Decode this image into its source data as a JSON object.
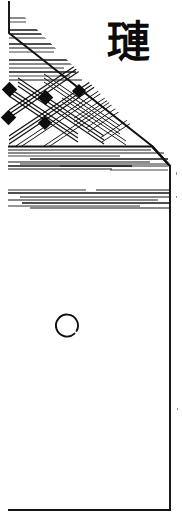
{
  "figure": {
    "medium": "scanned ink line drawing",
    "background_color": "#ffffff",
    "ink_color": "#101010",
    "width_px": 182,
    "height_px": 521
  },
  "label": {
    "character": "璉",
    "reading": "hun",
    "position": "upper-right",
    "color": "#0b0b0b"
  },
  "object_outline": {
    "description": "Vessel body with sloping shoulder, rendered as a closed polygon",
    "points": "9,1 9,33 152,146 170,166 170,510 8,510",
    "stroke_color": "#101010"
  },
  "regions": [
    {
      "name": "upper-hatched-triangle",
      "description": "Triangular shoulder zone filled with horizontal hatching and a lattice of crossed diagonal strokes",
      "y_range": [
        1,
        146
      ]
    },
    {
      "name": "horizontal-band-upper",
      "description": "Band of long horizontal strokes beneath the shoulder ridge",
      "y_range": [
        148,
        172
      ]
    },
    {
      "name": "horizontal-band-lower",
      "description": "Second band of long horizontal strokes",
      "y_range": [
        186,
        215
      ]
    },
    {
      "name": "plain-body",
      "description": "Undecorated lower body of the vessel",
      "y_range": [
        216,
        510
      ]
    }
  ],
  "mark": {
    "name": "incised-ring",
    "shape": "open circle / ring with a gap at lower-right",
    "cx": 68,
    "cy": 325,
    "r": 11,
    "stroke_color": "#101010"
  },
  "hatching": {
    "upper_triangle_line_count": 14,
    "band_upper_line_count": 9,
    "band_lower_line_count": 8,
    "lattice_node_count": 5
  }
}
